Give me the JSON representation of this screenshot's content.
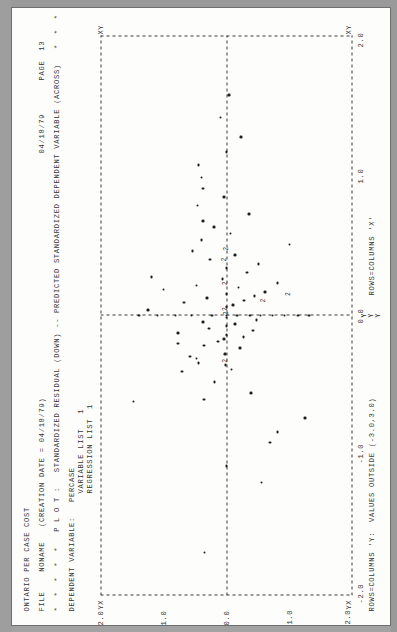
{
  "document": {
    "kind": "spss-printout-scan",
    "orientation": "rotated-90-ccw",
    "page_number": "13"
  },
  "header": {
    "title": "ONTARIO PER CASE COST",
    "file_line": "FILE    NONAME   (CREATION DATE = 04/18/79)",
    "star_rule": "*  *  *  *  *   P L O T :   STANDARDIZED RESIDUAL (DOWN) -- PREDICTED STANDARDIZED DEPENDENT VARIABLE (ACROSS)   *  *  *  *  *",
    "dependent_variable_line": "DEPENDENT VARIABLE:   PERCASE",
    "variable_list": "VARIABLE LIST   1",
    "regression_list": "REGRESSION LIST  1",
    "date": "04/18/79",
    "page_label": "PAGE  13"
  },
  "footer": {
    "rows_columns_x": "ROWS=COLUMNS 'X'",
    "rows_columns_y": "ROWS=COLUMNS 'Y:  VALUES OUTSIDE (-3.0,3.0)"
  },
  "axes": {
    "x_label": "PREDICTED STANDARDIZED DEPENDENT VARIABLE (ACROSS)",
    "y_label": "STANDARDIZED RESIDUAL (DOWN)",
    "x_ticks": [
      "-2.0",
      "-1.0",
      "0.0",
      "1.0",
      "2.0"
    ],
    "y_ticks": [
      "2.0",
      "1.0",
      "0.0",
      "-1.0",
      "-2.0"
    ],
    "corner_marks": [
      "YX",
      "X",
      "XY"
    ],
    "out_of_range_marker": "Y"
  },
  "chart_data": {
    "type": "scatter",
    "title": "STANDARDIZED RESIDUAL (DOWN) -- PREDICTED STANDARDIZED DEPENDENT VARIABLE (ACROSS)",
    "xlabel": "PREDICTED STANDARDIZED DEPENDENT VARIABLE",
    "ylabel": "STANDARDIZED RESIDUAL",
    "xlim": [
      -2.6,
      2.6
    ],
    "ylim": [
      -2.6,
      2.6
    ],
    "grid": true,
    "gridlines": {
      "x": [
        0.0
      ],
      "y": [
        0.0
      ]
    },
    "legend": "none",
    "overlap_symbol": "2",
    "points": [
      [
        -2.2,
        0.45
      ],
      [
        -1.55,
        -0.72
      ],
      [
        -1.4,
        0.0
      ],
      [
        -1.18,
        -0.9
      ],
      [
        -1.08,
        -1.05
      ],
      [
        -0.95,
        -1.62
      ],
      [
        -0.8,
        1.92
      ],
      [
        -0.78,
        0.46
      ],
      [
        -0.72,
        -0.5
      ],
      [
        -0.62,
        0.25
      ],
      [
        -0.52,
        0.92
      ],
      [
        -0.5,
        -0.1
      ],
      [
        -0.46,
        0.02
      ],
      [
        -0.44,
        0.58
      ],
      [
        -0.4,
        0.62
      ],
      [
        -0.38,
        0.75
      ],
      [
        -0.36,
        0.03
      ],
      [
        -0.3,
        -0.28
      ],
      [
        -0.28,
        0.46
      ],
      [
        -0.26,
        1.0
      ],
      [
        -0.24,
        0.18
      ],
      [
        -0.22,
        0.05
      ],
      [
        -0.2,
        -0.35
      ],
      [
        -0.18,
        0.0
      ],
      [
        -0.16,
        1.0
      ],
      [
        -0.14,
        -0.55
      ],
      [
        -0.12,
        0.36
      ],
      [
        -0.1,
        0.0
      ],
      [
        -0.08,
        -0.18
      ],
      [
        -0.06,
        0.48
      ],
      [
        -0.04,
        -0.62
      ],
      [
        -0.02,
        0.0
      ],
      [
        0.0,
        1.8
      ],
      [
        0.0,
        1.42
      ],
      [
        0.0,
        1.05
      ],
      [
        0.0,
        0.72
      ],
      [
        0.0,
        0.3
      ],
      [
        0.0,
        0.0
      ],
      [
        0.0,
        -0.22
      ],
      [
        0.0,
        -0.48
      ],
      [
        0.0,
        -0.7
      ],
      [
        0.0,
        -0.95
      ],
      [
        0.0,
        -1.2
      ],
      [
        0.0,
        -1.48
      ],
      [
        0.0,
        -1.7
      ],
      [
        0.05,
        1.62
      ],
      [
        0.08,
        0.0
      ],
      [
        0.1,
        -0.14
      ],
      [
        0.12,
        0.88
      ],
      [
        0.14,
        -0.36
      ],
      [
        0.16,
        0.4
      ],
      [
        0.18,
        -0.58
      ],
      [
        0.2,
        0.0
      ],
      [
        0.22,
        -0.8
      ],
      [
        0.24,
        1.3
      ],
      [
        0.26,
        -0.25
      ],
      [
        0.28,
        0.62
      ],
      [
        0.3,
        -1.05
      ],
      [
        0.34,
        0.08
      ],
      [
        0.36,
        1.55
      ],
      [
        0.4,
        -0.42
      ],
      [
        0.44,
        0.0
      ],
      [
        0.48,
        -0.66
      ],
      [
        0.52,
        0.34
      ],
      [
        0.56,
        -0.18
      ],
      [
        0.6,
        0.7
      ],
      [
        0.66,
        -1.3
      ],
      [
        0.7,
        0.52
      ],
      [
        0.76,
        -0.08
      ],
      [
        0.82,
        0.26
      ],
      [
        0.88,
        0.48
      ],
      [
        0.94,
        -0.46
      ],
      [
        1.02,
        0.6
      ],
      [
        1.1,
        0.05
      ],
      [
        1.18,
        0.48
      ],
      [
        1.28,
        0.52
      ],
      [
        1.4,
        0.58
      ],
      [
        1.52,
        0.0
      ],
      [
        1.66,
        -0.3
      ],
      [
        1.84,
        0.12
      ],
      [
        2.05,
        -0.05
      ]
    ],
    "overlap_points": [
      [
        -0.42,
        0.0
      ],
      [
        0.06,
        0.0
      ],
      [
        0.02,
        -0.03
      ],
      [
        0.3,
        0.0
      ],
      [
        0.52,
        0.02
      ],
      [
        0.14,
        -0.78
      ],
      [
        0.2,
        -1.3
      ],
      [
        0.62,
        -0.02
      ]
    ],
    "out_of_range_points": [
      [
        0.0,
        -2.95
      ],
      [
        0.0,
        -3.05
      ],
      [
        0.0,
        -3.15
      ]
    ]
  }
}
